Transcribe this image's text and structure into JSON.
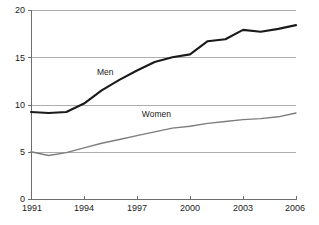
{
  "chart_data": {
    "type": "line",
    "title": "",
    "subtitle": "",
    "xlabel": "",
    "ylabel": "",
    "x": [
      1991,
      1992,
      1993,
      1994,
      1995,
      1996,
      1997,
      1998,
      1999,
      2000,
      2001,
      2002,
      2003,
      2004,
      2005,
      2006
    ],
    "xlim": [
      1991,
      2006
    ],
    "ylim": [
      0,
      20
    ],
    "grid": true,
    "grid_axis": "y",
    "legend_position": "inline-annotation",
    "xticks": [
      1991,
      1994,
      1997,
      2000,
      2003,
      2006
    ],
    "xtick_labels": [
      "1991",
      "1994",
      "1997",
      "2000",
      "2003",
      "2006"
    ],
    "yticks": [
      0,
      5,
      10,
      15,
      20
    ],
    "ytick_labels": [
      "0",
      "5",
      "10",
      "15",
      "20"
    ],
    "series": [
      {
        "name": "Men",
        "label": "Men",
        "color": "#1a1a1a",
        "stroke_width": 2.1,
        "label_x": 1995.2,
        "label_y": 13.15,
        "values": [
          9.2,
          9.1,
          9.2,
          10.1,
          11.5,
          12.6,
          13.6,
          14.5,
          15.0,
          15.3,
          16.7,
          16.9,
          17.9,
          17.7,
          18.0,
          18.4
        ]
      },
      {
        "name": "Women",
        "label": "Women",
        "color": "#7d7d7d",
        "stroke_width": 1.35,
        "label_x": 1998.1,
        "label_y": 8.72,
        "values": [
          5.0,
          4.6,
          4.9,
          5.4,
          5.9,
          6.3,
          6.7,
          7.1,
          7.5,
          7.7,
          8.0,
          8.2,
          8.4,
          8.5,
          8.7,
          9.1
        ]
      }
    ],
    "axis_color": "#6e6e6e",
    "grid_color": "#9a9a9a",
    "background": "#ffffff"
  },
  "geometry": {
    "plot_left": 31,
    "plot_right": 296,
    "plot_top": 10,
    "plot_bottom": 199
  }
}
